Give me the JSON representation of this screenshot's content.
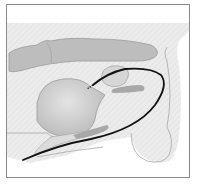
{
  "figure": {
    "colors": {
      "background": "#ffffff",
      "frame_border": "#8a8a8a",
      "tissue_fill": "#ebebeb",
      "organ_fill": "#cfcfcf",
      "organ_stroke": "#9a9a9a",
      "intestine_fill": "#b9b9b9",
      "catheter": "#111111"
    }
  }
}
